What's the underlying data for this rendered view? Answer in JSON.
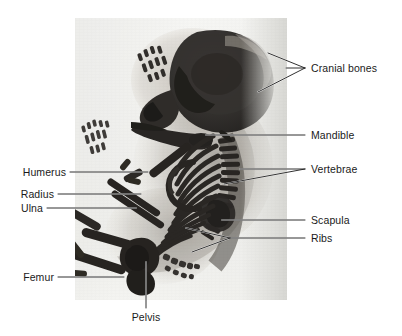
{
  "figure": {
    "background_color": "#ffffff",
    "plate": {
      "name": "cleared-and-stained skeletal specimen photograph",
      "left": 75,
      "top": 18,
      "width": 212,
      "height": 282,
      "base_color": "#f2f2ef",
      "bone_color": "#232323",
      "soft_tissue_color": "#9a958f"
    }
  },
  "labels": [
    {
      "id": "cranial-bones",
      "text": "Cranial bones",
      "side": "right",
      "x": 311,
      "y": 62,
      "leaders": [
        {
          "points": "305,68 286,68"
        },
        {
          "points": "305,68 268,53"
        },
        {
          "points": "305,68 258,92"
        }
      ]
    },
    {
      "id": "mandible",
      "text": "Mandible",
      "side": "right",
      "x": 311,
      "y": 129,
      "leaders": [
        {
          "points": "305,135 206,135"
        }
      ]
    },
    {
      "id": "vertebrae",
      "text": "Vertebrae",
      "side": "right",
      "x": 311,
      "y": 163,
      "leaders": [
        {
          "points": "305,169 240,169"
        },
        {
          "points": "305,169 224,184"
        }
      ]
    },
    {
      "id": "scapula",
      "text": "Scapula",
      "side": "right",
      "x": 311,
      "y": 214,
      "leaders": [
        {
          "points": "305,220 222,220"
        }
      ]
    },
    {
      "id": "ribs",
      "text": "Ribs",
      "side": "right",
      "x": 311,
      "y": 232,
      "leaders": [
        {
          "points": "305,238 230,238"
        },
        {
          "points": "230,238 186,228"
        },
        {
          "points": "230,238 192,252"
        }
      ]
    },
    {
      "id": "humerus",
      "text": "Humerus",
      "side": "left",
      "x": 20,
      "y": 166,
      "leaders": [
        {
          "points": "70,172 148,172"
        }
      ]
    },
    {
      "id": "radius",
      "text": "Radius",
      "side": "left",
      "x": 20,
      "y": 188,
      "leaders": [
        {
          "points": "58,194 141,194"
        }
      ]
    },
    {
      "id": "ulna",
      "text": "Ulna",
      "side": "left",
      "x": 20,
      "y": 202,
      "leaders": [
        {
          "points": "47,208 136,208"
        }
      ]
    },
    {
      "id": "femur",
      "text": "Femur",
      "side": "left",
      "x": 20,
      "y": 271,
      "leaders": [
        {
          "points": "58,277 124,277"
        }
      ]
    },
    {
      "id": "pelvis",
      "text": "Pelvis",
      "side": "center",
      "x": 131,
      "y": 311,
      "leaders": [
        {
          "points": "146,308 146,262"
        }
      ]
    }
  ],
  "leader_style": {
    "color": "#1a1a1a",
    "width": 0.9,
    "highlight_color": "#ffffff"
  }
}
